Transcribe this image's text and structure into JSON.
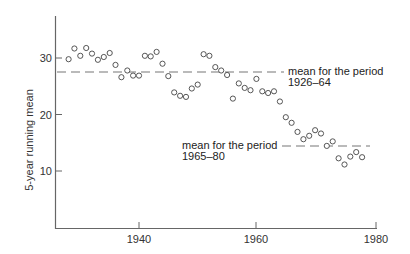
{
  "chart_data": {
    "type": "scatter",
    "title": "",
    "xlabel": "",
    "ylabel": "5-year running mean",
    "xlim": [
      1925.8,
      1981
    ],
    "ylim": [
      0,
      37
    ],
    "grid": false,
    "legend": null,
    "x_ticks": [
      1940,
      1960,
      1980
    ],
    "x_tick_labels": [
      "1940",
      "1960",
      "1980"
    ],
    "y_ticks": [
      10,
      20,
      30
    ],
    "y_tick_labels": [
      "10",
      "20",
      "30"
    ],
    "series": [
      {
        "name": "5-year running mean",
        "marker": "open-circle",
        "x": [
          1928,
          1929,
          1930,
          1931,
          1932,
          1933,
          1934,
          1935,
          1936,
          1937,
          1938,
          1939,
          1940,
          1941,
          1942,
          1943,
          1944,
          1945,
          1946,
          1947,
          1948,
          1949,
          1950,
          1951,
          1952,
          1953,
          1954,
          1955,
          1956,
          1957,
          1958,
          1959,
          1960,
          1961,
          1962,
          1963,
          1964,
          1965,
          1966,
          1967,
          1968,
          1969,
          1970,
          1971,
          1972,
          1973,
          1974,
          1975,
          1976,
          1977,
          1978
        ],
        "y": [
          29.8,
          31.7,
          30.4,
          31.8,
          30.8,
          29.7,
          30.2,
          30.9,
          28.8,
          26.6,
          27.8,
          26.9,
          26.9,
          30.4,
          30.3,
          31.1,
          29.0,
          26.8,
          23.9,
          23.3,
          23.1,
          24.6,
          25.3,
          30.7,
          30.4,
          28.4,
          27.8,
          27.0,
          22.8,
          25.5,
          24.7,
          24.3,
          26.3,
          24.1,
          23.8,
          24.1,
          22.3,
          19.5,
          18.5,
          16.9,
          15.6,
          16.2,
          17.2,
          16.6,
          14.4,
          15.2,
          12.2,
          11.1,
          12.5,
          13.3,
          12.4
        ]
      }
    ],
    "reference_lines": [
      {
        "name": "mean 1926-64",
        "y": 27.5,
        "x_start": 1925.8,
        "x_end": 1964.7,
        "style": "dashed"
      },
      {
        "name": "mean 1965-80",
        "y": 14.4,
        "x_start": 1964.1,
        "x_end": 1979.2,
        "style": "dashed"
      }
    ],
    "annotations": [
      {
        "text_line1": "mean for the period",
        "text_line2": "1926–64",
        "anchor": "end of upper mean line"
      },
      {
        "text_line1": "mean for the period",
        "text_line2": "1965–80",
        "anchor": "start of lower mean line"
      }
    ]
  },
  "labels": {
    "ylabel": "5-year running mean",
    "annot_upper_1": "mean for the period",
    "annot_upper_2": "1926–64",
    "annot_lower_1": "mean for the period",
    "annot_lower_2": "1965–80",
    "xtick_0": "1940",
    "xtick_1": "1960",
    "xtick_2": "1980",
    "ytick_0": "10",
    "ytick_1": "20",
    "ytick_2": "30"
  }
}
